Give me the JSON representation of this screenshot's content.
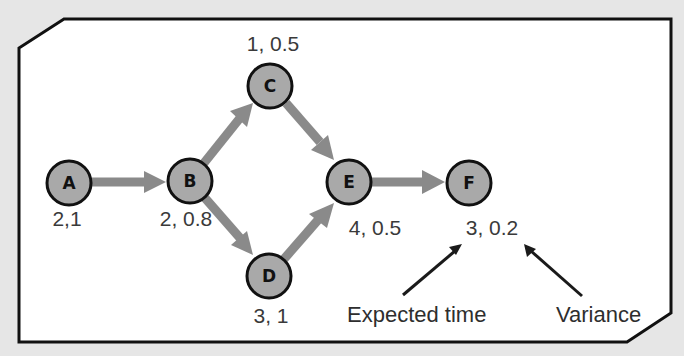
{
  "diagram": {
    "type": "activity-on-node network (PERT)",
    "colors": {
      "background": "#e6e6e6",
      "panel": "#ffffff",
      "border": "#111111",
      "node_fill": "#a9a9a9",
      "edge": "#8a8a8a",
      "text": "#3a3a3a"
    },
    "nodes": [
      {
        "id": "A",
        "label": "A",
        "stats": "2,1",
        "expected_time": 2,
        "variance": 1,
        "cx": 69,
        "cy": 183
      },
      {
        "id": "B",
        "label": "B",
        "stats": "2, 0.8",
        "expected_time": 2,
        "variance": 0.8,
        "cx": 190,
        "cy": 181
      },
      {
        "id": "C",
        "label": "C",
        "stats": "1, 0.5",
        "expected_time": 1,
        "variance": 0.5,
        "cx": 270,
        "cy": 86
      },
      {
        "id": "D",
        "label": "D",
        "stats": "3, 1",
        "expected_time": 3,
        "variance": 1,
        "cx": 269,
        "cy": 276
      },
      {
        "id": "E",
        "label": "E",
        "stats": "4, 0.5",
        "expected_time": 4,
        "variance": 0.5,
        "cx": 349,
        "cy": 182
      },
      {
        "id": "F",
        "label": "F",
        "stats": "3, 0.2",
        "expected_time": 3,
        "variance": 0.2,
        "cx": 469,
        "cy": 183
      }
    ],
    "edges": [
      {
        "from": "A",
        "to": "B"
      },
      {
        "from": "B",
        "to": "C"
      },
      {
        "from": "B",
        "to": "D"
      },
      {
        "from": "C",
        "to": "E"
      },
      {
        "from": "D",
        "to": "E"
      },
      {
        "from": "E",
        "to": "F"
      }
    ],
    "legend": {
      "expected_time_label": "Expected time",
      "variance_label": "Variance"
    }
  }
}
